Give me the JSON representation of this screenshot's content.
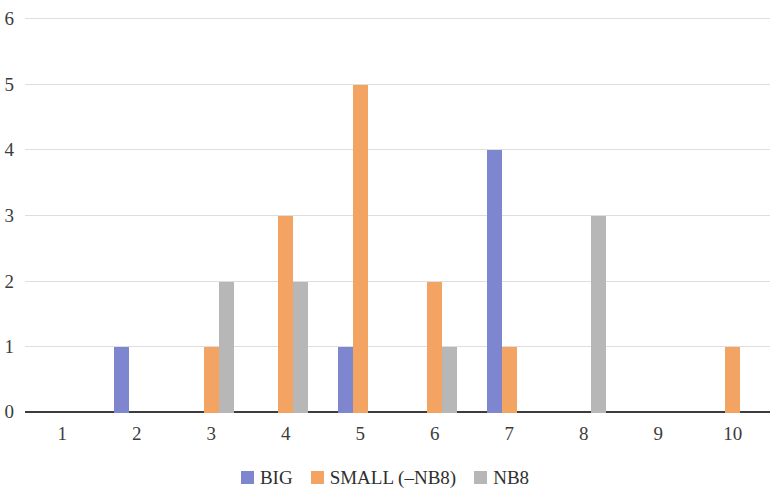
{
  "chart_data": {
    "type": "bar",
    "title": "",
    "subtitle": "",
    "xlabel": "",
    "ylabel": "",
    "categories": [
      "1",
      "2",
      "3",
      "4",
      "5",
      "6",
      "7",
      "8",
      "9",
      "10"
    ],
    "series": [
      {
        "name": "BIG",
        "color": "#7d86cf",
        "values": [
          0,
          1,
          0,
          0,
          1,
          0,
          4,
          0,
          0,
          0
        ]
      },
      {
        "name": "SMALL (–NB8)",
        "color": "#f4a462",
        "values": [
          0,
          0,
          1,
          3,
          5,
          2,
          1,
          0,
          0,
          1
        ]
      },
      {
        "name": "NB8",
        "color": "#b7b7b7",
        "values": [
          0,
          0,
          2,
          2,
          0,
          1,
          0,
          3,
          0,
          0
        ]
      }
    ],
    "ylim": [
      0,
      6
    ],
    "y_ticks": [
      "0",
      "1",
      "2",
      "3",
      "4",
      "5",
      "6"
    ],
    "y_tick_values": [
      0,
      1,
      2,
      3,
      4,
      5,
      6
    ],
    "grid": true,
    "grid_axis": "y",
    "grid_color": "#dedede",
    "axis_color": "#3c3c3c",
    "legend": {
      "position": "bottom",
      "entries": [
        {
          "label": "BIG",
          "color": "#7d86cf"
        },
        {
          "label": "SMALL (–NB8)",
          "color": "#f4a462"
        },
        {
          "label": "NB8",
          "color": "#b7b7b7"
        }
      ]
    }
  }
}
